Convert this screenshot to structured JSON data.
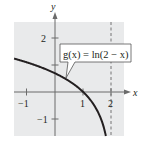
{
  "chart_data": {
    "type": "line",
    "title": "",
    "function_label": "g(x) = ln(2 − x)",
    "xlabel": "x",
    "ylabel": "y",
    "xlim": [
      -1.45,
      2.45
    ],
    "ylim": [
      -1.65,
      2.6
    ],
    "x_ticks": [
      -1,
      1,
      2
    ],
    "x_tick_labels": [
      "−1",
      "1",
      "2"
    ],
    "y_ticks": [
      -1,
      1,
      2
    ],
    "y_tick_labels": [
      "−1",
      "",
      "2"
    ],
    "asymptote": {
      "type": "vertical",
      "x": 2,
      "style": "dashed"
    },
    "grid": false,
    "background": "#e9eaeb",
    "series": [
      {
        "name": "g(x) = ln(2 − x)",
        "x": [
          -1.45,
          -1,
          -0.5,
          0,
          0.5,
          1,
          1.25,
          1.5,
          1.65,
          1.75,
          1.8
        ],
        "y": [
          1.24,
          1.1,
          0.92,
          0.69,
          0.41,
          0,
          -0.29,
          -0.69,
          -1.05,
          -1.39,
          -1.61
        ]
      }
    ]
  },
  "labels": {
    "x_axis": "x",
    "y_axis": "y",
    "function": "g(x) = ln(2 − x)",
    "tick_x_neg1": "−1",
    "tick_x_1": "1",
    "tick_x_2": "2",
    "tick_y_2": "2",
    "tick_y_neg1": "−1"
  }
}
